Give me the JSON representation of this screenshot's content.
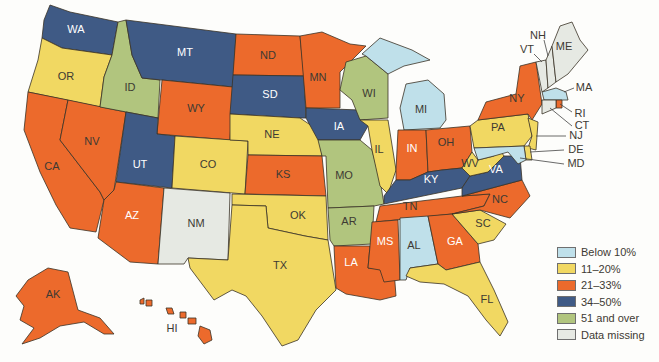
{
  "chart_data": {
    "type": "choropleth",
    "title": "",
    "legend": [
      {
        "key": "below10",
        "label": "Below 10%",
        "color": "#bfe0ea"
      },
      {
        "key": "11_20",
        "label": "11–20%",
        "color": "#f1d862"
      },
      {
        "key": "21_33",
        "label": "21–33%",
        "color": "#ec6a2c"
      },
      {
        "key": "34_50",
        "label": "34–50%",
        "color": "#3f5a85"
      },
      {
        "key": "51plus",
        "label": "51 and over",
        "color": "#b1c57e"
      },
      {
        "key": "missing",
        "label": "Data missing",
        "color": "#e6e9e3"
      }
    ],
    "legend_position": "bottom-right",
    "states": {
      "WA": "34_50",
      "OR": "11_20",
      "CA": "21_33",
      "NV": "21_33",
      "ID": "51plus",
      "MT": "34_50",
      "WY": "21_33",
      "UT": "34_50",
      "AZ": "21_33",
      "CO": "11_20",
      "NM": "missing",
      "ND": "21_33",
      "SD": "34_50",
      "NE": "11_20",
      "KS": "21_33",
      "OK": "11_20",
      "TX": "11_20",
      "MN": "21_33",
      "IA": "34_50",
      "MO": "51plus",
      "AR": "51plus",
      "LA": "21_33",
      "WI": "51plus",
      "IL": "11_20",
      "MI": "below10",
      "IN": "21_33",
      "OH": "21_33",
      "KY": "34_50",
      "TN": "21_33",
      "MS": "21_33",
      "AL": "below10",
      "GA": "21_33",
      "FL": "11_20",
      "SC": "11_20",
      "NC": "21_33",
      "VA": "34_50",
      "WV": "11_20",
      "PA": "11_20",
      "NY": "21_33",
      "VT": "missing",
      "NH": "missing",
      "ME": "missing",
      "MA": "below10",
      "RI": "21_33",
      "CT": "missing",
      "NJ": "11_20",
      "DE": "11_20",
      "MD": "below10",
      "AK": "21_33",
      "HI": "21_33"
    }
  },
  "labels": {
    "WA": "WA",
    "OR": "OR",
    "CA": "CA",
    "NV": "NV",
    "ID": "ID",
    "MT": "MT",
    "WY": "WY",
    "UT": "UT",
    "AZ": "AZ",
    "CO": "CO",
    "NM": "NM",
    "ND": "ND",
    "SD": "SD",
    "NE": "NE",
    "KS": "KS",
    "OK": "OK",
    "TX": "TX",
    "MN": "MN",
    "IA": "IA",
    "MO": "MO",
    "AR": "AR",
    "LA": "LA",
    "WI": "WI",
    "IL": "IL",
    "MI": "MI",
    "IN": "IN",
    "OH": "OH",
    "KY": "KY",
    "TN": "TN",
    "MS": "MS",
    "AL": "AL",
    "GA": "GA",
    "FL": "FL",
    "SC": "SC",
    "NC": "NC",
    "VA": "VA",
    "WV": "WV",
    "PA": "PA",
    "NY": "NY",
    "VT": "VT",
    "NH": "NH",
    "ME": "ME",
    "MA": "MA",
    "RI": "RI",
    "CT": "CT",
    "NJ": "NJ",
    "DE": "DE",
    "MD": "MD",
    "AK": "AK",
    "HI": "HI"
  }
}
